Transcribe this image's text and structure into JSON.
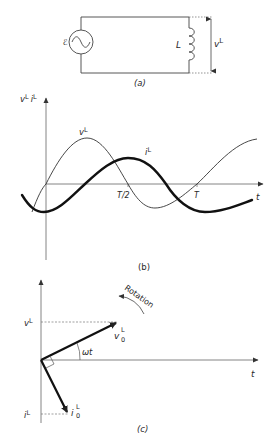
{
  "figure": {
    "panels": [
      {
        "id": "a",
        "caption": "(a)",
        "title": "AC source connected to an inductor",
        "components": {
          "source_label": "ℰ",
          "inductor_label": "L",
          "voltage_label": {
            "base": "v",
            "sup": "L"
          }
        }
      },
      {
        "id": "b",
        "caption": "(b)",
        "axis_labels": {
          "y": {
            "v_base": "v",
            "v_sup": "L",
            "i_base": "i",
            "i_sup": "L"
          },
          "x": "t"
        },
        "ticks": [
          "T/2",
          "T"
        ],
        "curves": [
          {
            "name": "voltage",
            "label_base": "v",
            "label_sup": "L",
            "style": "thin",
            "phase": "leads by 90°"
          },
          {
            "name": "current",
            "label_base": "i",
            "label_sup": "L",
            "style": "thick",
            "phase": "lags by 90°"
          }
        ]
      },
      {
        "id": "c",
        "caption": "(c)",
        "axis_labels": {
          "x": "t"
        },
        "phasors": [
          {
            "name": "voltage-phasor",
            "label_base": "v",
            "label_sub": "0",
            "label_sup": "L",
            "projection_base": "v",
            "projection_sup": "L"
          },
          {
            "name": "current-phasor",
            "label_base": "i",
            "label_sub": "0",
            "label_sup": "L",
            "projection_base": "i",
            "projection_sup": "L"
          }
        ],
        "angle_label": "ωt",
        "rotation_label": "Rotation"
      }
    ]
  }
}
